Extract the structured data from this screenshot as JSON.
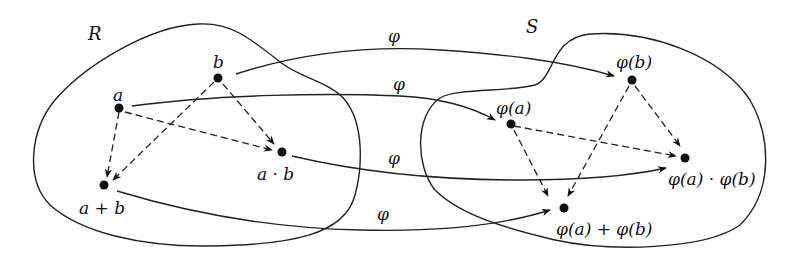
{
  "diagram": {
    "sets": [
      {
        "id": "R",
        "label": "R"
      },
      {
        "id": "S",
        "label": "S"
      }
    ],
    "nodes": [
      {
        "id": "a",
        "set": "R",
        "label": "a"
      },
      {
        "id": "b",
        "set": "R",
        "label": "b"
      },
      {
        "id": "a_plus_b",
        "set": "R",
        "label": "a + b"
      },
      {
        "id": "a_times_b",
        "set": "R",
        "label": "a · b"
      },
      {
        "id": "phi_a",
        "set": "S",
        "label": "φ(a)"
      },
      {
        "id": "phi_b",
        "set": "S",
        "label": "φ(b)"
      },
      {
        "id": "phi_a_plus_phi_b",
        "set": "S",
        "label": "φ(a) + φ(b)"
      },
      {
        "id": "phi_a_times_phi_b",
        "set": "S",
        "label": "φ(a) · φ(b)"
      }
    ],
    "mapping_label": "φ",
    "mappings": [
      {
        "from": "b",
        "to": "phi_b",
        "label": "φ"
      },
      {
        "from": "a",
        "to": "phi_a",
        "label": "φ"
      },
      {
        "from": "a_times_b",
        "to": "phi_a_times_phi_b",
        "label": "φ"
      },
      {
        "from": "a_plus_b",
        "to": "phi_a_plus_phi_b",
        "label": "φ"
      }
    ],
    "operations": [
      {
        "from": "a",
        "to": "a_plus_b",
        "style": "dashed"
      },
      {
        "from": "b",
        "to": "a_plus_b",
        "style": "dashed"
      },
      {
        "from": "a",
        "to": "a_times_b",
        "style": "dashed"
      },
      {
        "from": "b",
        "to": "a_times_b",
        "style": "dashed"
      },
      {
        "from": "phi_a",
        "to": "phi_a_plus_phi_b",
        "style": "dashed"
      },
      {
        "from": "phi_b",
        "to": "phi_a_plus_phi_b",
        "style": "dashed"
      },
      {
        "from": "phi_a",
        "to": "phi_a_times_phi_b",
        "style": "dashed"
      },
      {
        "from": "phi_b",
        "to": "phi_a_times_phi_b",
        "style": "dashed"
      }
    ]
  }
}
